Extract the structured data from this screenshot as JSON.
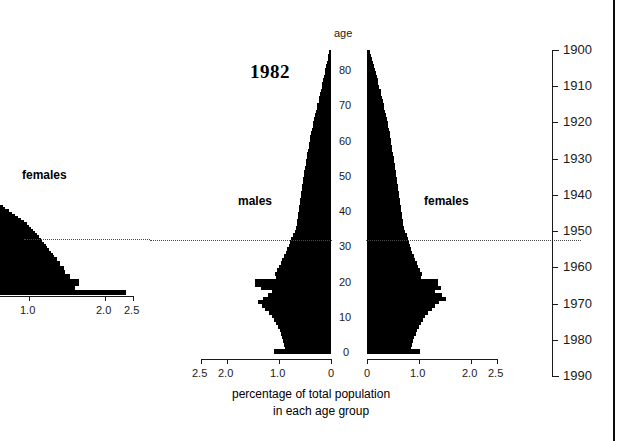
{
  "figure": {
    "title": "1982",
    "age_axis_label": "age",
    "x_axis_caption_line1": "percentage of total population",
    "x_axis_caption_line2": "in each age group",
    "males_label": "males",
    "females_label": "females",
    "accent_color": "#000000",
    "cohort_line_color": "#4a4a4a",
    "cohort_line_age": 35,
    "cohort_line_year": 1950
  },
  "left_partial_chart": {
    "females_label": "females",
    "x_ticks": [
      "1.0",
      "2.0",
      "2.5"
    ],
    "note": "cut-off right half of the preceding figure"
  },
  "age_axis": {
    "label": "age",
    "ticks": [
      "0",
      "10",
      "20",
      "30",
      "40",
      "50",
      "60",
      "70",
      "80"
    ],
    "min": 0,
    "max": 90
  },
  "x_axis": {
    "males_ticks": [
      "2.5",
      "2.0",
      "1.0",
      "0"
    ],
    "females_ticks": [
      "0",
      "1.0",
      "2.0",
      "2.5"
    ],
    "min": 0,
    "max": 2.5,
    "unit": "percent"
  },
  "year_axis": {
    "ticks": [
      "1900",
      "1910",
      "1920",
      "1930",
      "1940",
      "1950",
      "1960",
      "1970",
      "1980",
      "1990"
    ],
    "min": 1900,
    "max": 1990
  },
  "chart_data": {
    "type": "bar",
    "title": "1982",
    "subtitle": "",
    "xlabel": "percentage of total population in each age group",
    "ylabel": "age",
    "orientation": "horizontal",
    "layout": "population-pyramid",
    "xlim": [
      0,
      2.5
    ],
    "ylim": [
      0,
      90
    ],
    "grid": false,
    "legend": [
      "males",
      "females"
    ],
    "legend_position": "inside-upper-left / inside-upper-right",
    "annotations": [
      {
        "text": "1982",
        "kind": "year-title"
      },
      {
        "text": "1950 cohort",
        "kind": "dotted-horizontal-line",
        "age": 35,
        "year": 1950
      }
    ],
    "secondary_axis": {
      "name": "birth year",
      "side": "right",
      "ticks": [
        1900,
        1910,
        1920,
        1930,
        1940,
        1950,
        1960,
        1970,
        1980,
        1990
      ]
    },
    "ages": [
      0,
      1,
      2,
      3,
      4,
      5,
      6,
      7,
      8,
      9,
      10,
      11,
      12,
      13,
      14,
      15,
      16,
      17,
      18,
      19,
      20,
      21,
      22,
      23,
      24,
      25,
      26,
      27,
      28,
      29,
      30,
      31,
      32,
      33,
      34,
      35,
      36,
      37,
      38,
      39,
      40,
      41,
      42,
      43,
      44,
      45,
      46,
      47,
      48,
      49,
      50,
      51,
      52,
      53,
      54,
      55,
      56,
      57,
      58,
      59,
      60,
      61,
      62,
      63,
      64,
      65,
      66,
      67,
      68,
      69,
      70,
      71,
      72,
      73,
      74,
      75,
      76,
      77,
      78,
      79,
      80,
      81,
      82,
      83,
      84,
      85
    ],
    "series": [
      {
        "name": "males",
        "side": "left",
        "values": [
          1.09,
          0.88,
          0.9,
          0.92,
          0.94,
          0.96,
          0.99,
          1.02,
          1.05,
          1.09,
          1.13,
          1.2,
          1.27,
          1.33,
          1.4,
          1.3,
          1.22,
          1.14,
          1.34,
          1.47,
          1.47,
          1.06,
          1.07,
          1.04,
          1.0,
          0.97,
          0.94,
          0.9,
          0.87,
          0.84,
          0.81,
          0.78,
          0.76,
          0.73,
          0.7,
          0.68,
          0.66,
          0.65,
          0.64,
          0.63,
          0.62,
          0.61,
          0.6,
          0.59,
          0.58,
          0.57,
          0.56,
          0.55,
          0.54,
          0.53,
          0.52,
          0.51,
          0.5,
          0.49,
          0.48,
          0.47,
          0.46,
          0.44,
          0.43,
          0.42,
          0.41,
          0.4,
          0.38,
          0.37,
          0.35,
          0.34,
          0.32,
          0.3,
          0.29,
          0.27,
          0.26,
          0.24,
          0.23,
          0.21,
          0.2,
          0.18,
          0.17,
          0.15,
          0.14,
          0.12,
          0.11,
          0.09,
          0.08,
          0.06,
          0.05,
          0.04
        ]
      },
      {
        "name": "females",
        "side": "right",
        "values": [
          1.01,
          0.85,
          0.87,
          0.89,
          0.91,
          0.94,
          0.97,
          1.0,
          1.03,
          1.07,
          1.11,
          1.18,
          1.25,
          1.31,
          1.38,
          1.51,
          1.45,
          1.3,
          1.43,
          1.37,
          1.37,
          1.04,
          1.05,
          1.02,
          0.99,
          0.96,
          0.93,
          0.9,
          0.87,
          0.84,
          0.82,
          0.8,
          0.78,
          0.76,
          0.74,
          0.72,
          0.7,
          0.69,
          0.68,
          0.67,
          0.66,
          0.65,
          0.64,
          0.63,
          0.62,
          0.61,
          0.6,
          0.59,
          0.58,
          0.57,
          0.56,
          0.55,
          0.54,
          0.53,
          0.52,
          0.51,
          0.5,
          0.49,
          0.48,
          0.47,
          0.46,
          0.45,
          0.44,
          0.42,
          0.41,
          0.4,
          0.38,
          0.37,
          0.35,
          0.33,
          0.32,
          0.3,
          0.29,
          0.27,
          0.26,
          0.24,
          0.22,
          0.21,
          0.19,
          0.17,
          0.16,
          0.14,
          0.12,
          0.1,
          0.08,
          0.06
        ]
      }
    ],
    "left_partial_series": {
      "name": "females (previous figure, clipped)",
      "ages": [
        0,
        1,
        2,
        3,
        4,
        5,
        6,
        7,
        8,
        9,
        10,
        11,
        12,
        13,
        14,
        15,
        16,
        17,
        18,
        19,
        20,
        21,
        22,
        23,
        24,
        25,
        26,
        27,
        28,
        29,
        30,
        31,
        32,
        33,
        34,
        35,
        36,
        37,
        38,
        39,
        40
      ],
      "values": [
        2.35,
        2.35,
        1.4,
        1.4,
        1.48,
        1.48,
        1.48,
        1.3,
        1.3,
        1.22,
        1.22,
        1.2,
        1.2,
        1.12,
        1.12,
        1.06,
        1.06,
        1.0,
        0.98,
        0.95,
        0.92,
        0.88,
        0.86,
        0.82,
        0.79,
        0.76,
        0.72,
        0.69,
        0.66,
        0.62,
        0.58,
        0.54,
        0.5,
        0.45,
        0.4,
        0.34,
        0.28,
        0.22,
        0.16,
        0.1,
        0.05
      ]
    }
  }
}
